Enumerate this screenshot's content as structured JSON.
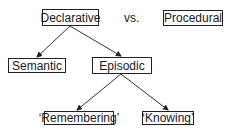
{
  "diagram": {
    "nodes": {
      "declarative": {
        "label": "Declarative"
      },
      "procedural": {
        "label": "Procedural"
      },
      "semantic": {
        "label": "Semantic"
      },
      "episodic": {
        "label": "Episodic"
      },
      "remembering": {
        "label": "‘Remembering’"
      },
      "knowing": {
        "label": "‘Knowing’"
      }
    },
    "versus_label": "vs.",
    "edges": [
      {
        "from": "Declarative",
        "to": "Semantic"
      },
      {
        "from": "Declarative",
        "to": "Episodic"
      },
      {
        "from": "Episodic",
        "to": "'Remembering'"
      },
      {
        "from": "Episodic",
        "to": "'Knowing'"
      }
    ],
    "colors": {
      "stroke": "#222222",
      "background": "#ffffff"
    }
  }
}
